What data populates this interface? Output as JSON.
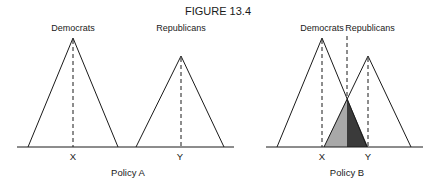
{
  "figure": {
    "title": "FIGURE 13.4",
    "colors": {
      "line": "#1a1a1a",
      "shade_left": "#a8a8a8",
      "shade_right": "#3a3a3a"
    }
  },
  "panels": [
    {
      "caption": "Policy A",
      "groups": [
        {
          "label": "Democrats",
          "position_label": "X"
        },
        {
          "label": "Republicans",
          "position_label": "Y"
        }
      ]
    },
    {
      "caption": "Policy B",
      "groups": [
        {
          "label": "Democrats",
          "position_label": "X"
        },
        {
          "label": "Republicans",
          "position_label": "Y"
        }
      ],
      "overlap_shaded": true
    }
  ]
}
